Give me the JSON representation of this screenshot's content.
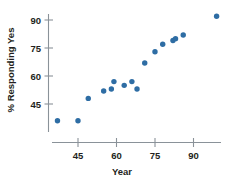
{
  "chart_data": {
    "type": "scatter",
    "title": "",
    "subtitle": "",
    "xlabel": "Year",
    "ylabel": "% Responding Yes",
    "xlim": [
      35,
      101
    ],
    "ylim": [
      32,
      95
    ],
    "xticks": [
      45,
      60,
      75,
      90
    ],
    "xtick_labels": [
      "45",
      "60",
      "75",
      "90"
    ],
    "yticks": [
      45,
      60,
      75,
      90
    ],
    "ytick_labels": [
      "45",
      "60",
      "75",
      "90"
    ],
    "grid": false,
    "legend": null,
    "marker_color": "#2e6da4",
    "axis_color": "#8a9299",
    "background_color": "#ffffff",
    "points": [
      {
        "x": 37,
        "y": 36
      },
      {
        "x": 45,
        "y": 36
      },
      {
        "x": 49,
        "y": 48
      },
      {
        "x": 55,
        "y": 52
      },
      {
        "x": 58,
        "y": 53
      },
      {
        "x": 59,
        "y": 57
      },
      {
        "x": 63,
        "y": 55
      },
      {
        "x": 66,
        "y": 57
      },
      {
        "x": 68,
        "y": 53
      },
      {
        "x": 71,
        "y": 67
      },
      {
        "x": 75,
        "y": 73
      },
      {
        "x": 78,
        "y": 77
      },
      {
        "x": 82,
        "y": 79
      },
      {
        "x": 83,
        "y": 80
      },
      {
        "x": 86,
        "y": 82
      },
      {
        "x": 99,
        "y": 92
      }
    ]
  },
  "axes": {
    "x_title": "Year",
    "y_title": "% Responding Yes",
    "x_tick_labels": [
      "45",
      "60",
      "75",
      "90"
    ],
    "y_tick_labels": [
      "45",
      "60",
      "75",
      "90"
    ]
  }
}
